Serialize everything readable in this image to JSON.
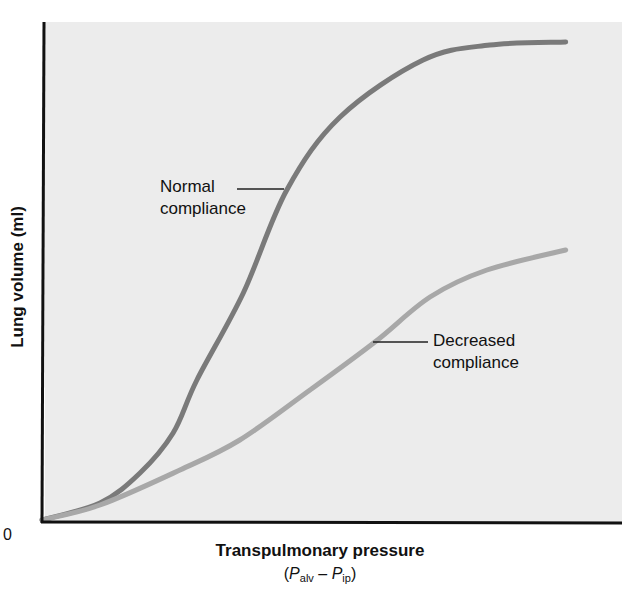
{
  "chart_data": {
    "type": "line",
    "title": "",
    "xlabel": "Transpulmonary pressure",
    "xlabel_sub": {
      "open": "(",
      "p1": "P",
      "p1_sub": "alv",
      "minus": " – ",
      "p2": "P",
      "p2_sub": "ip",
      "close": ")"
    },
    "ylabel": "Lung volume (ml)",
    "origin_label": "0",
    "xlim": [
      0,
      100
    ],
    "ylim": [
      0,
      100
    ],
    "grid": false,
    "legend": "inline annotations",
    "axis_units_note": "No numeric tick labels shown; values are relative (0-100 of plot extent)",
    "background_color": "#ececec",
    "series": [
      {
        "name": "Normal compliance",
        "label_lines": [
          "Normal",
          "compliance"
        ],
        "color": "#7a7a7a",
        "x": [
          0,
          10,
          16.9,
          22.6,
          26.7,
          34.7,
          42.2,
          51.4,
          65.7,
          77.2,
          90.3
        ],
        "y": [
          0.4,
          3.8,
          9.8,
          17.8,
          28.4,
          45.8,
          66.4,
          81,
          92.4,
          95.4,
          96
        ]
      },
      {
        "name": "Decreased compliance",
        "label_lines": [
          "Decreased",
          "compliance"
        ],
        "color": "#a8a8a8",
        "x": [
          0,
          10,
          23.8,
          34.1,
          46.2,
          57.4,
          66.9,
          76.7,
          90.3
        ],
        "y": [
          0.4,
          3.4,
          10.4,
          16.4,
          26.4,
          36,
          45,
          50.4,
          54.4
        ]
      }
    ]
  }
}
